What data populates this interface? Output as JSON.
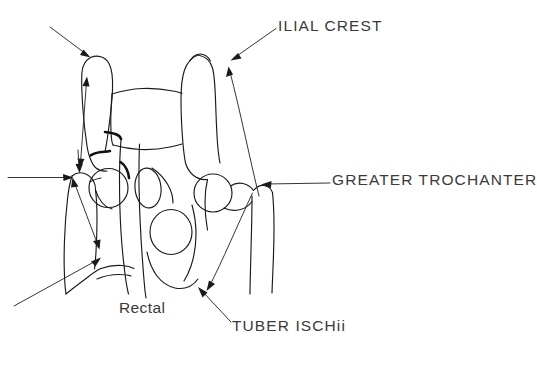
{
  "figure": {
    "kind": "hand-drawn anatomical line drawing",
    "background_color": "#ffffff",
    "ink_color": "#1a1a1a",
    "text_color": "#3a3a3a",
    "width": 514,
    "height": 370
  },
  "labels": {
    "ilial_crest": "ILIAL CREST",
    "greater_trochanter": "GREATER TROCHANTER",
    "tuber_ischii": "TUBER ISCHii",
    "rectal": "Rectal"
  },
  "annotations": [
    {
      "id": "ilial-crest-right",
      "label": "ILIAL CREST",
      "leader_from": [
        272,
        28
      ],
      "points_to": [
        232,
        58
      ],
      "description": "leader from ILIAL CREST text to right ilium crest apex"
    },
    {
      "id": "ilial-crest-left-unlabeled",
      "label": "",
      "leader_from": [
        50,
        26
      ],
      "points_to": [
        90,
        56
      ],
      "description": "unlabeled arrow pointing at left ilium crest apex"
    },
    {
      "id": "greater-trochanter-right",
      "label": "GREATER TROCHANTER",
      "leader_from": [
        328,
        182
      ],
      "points_to": [
        258,
        185
      ],
      "description": "horizontal leader from GREATER TROCHANTER text to right greater trochanter"
    },
    {
      "id": "greater-trochanter-left-unlabeled",
      "label": "",
      "leader_from": [
        8,
        178
      ],
      "points_to": [
        70,
        178
      ],
      "description": "horizontal unlabeled arrow pointing at left greater trochanter"
    },
    {
      "id": "tuber-ischii-left",
      "label": "TUBER ISCHii",
      "leader_from": [
        230,
        325
      ],
      "points_to": [
        198,
        288
      ],
      "description": "leader from TUBER ISCHii text to left tuber ischii"
    },
    {
      "id": "ilium-length-measure",
      "label": "",
      "leader_from": [
        79,
        168
      ],
      "points_to": [
        86,
        78
      ],
      "description": "double-headed vertical measurement arrow along left ilium"
    },
    {
      "id": "femoral-neck-measure",
      "label": "",
      "leader_from": [
        75,
        180
      ],
      "points_to": [
        100,
        250
      ],
      "description": "double-headed oblique measurement arrow across left femoral neck"
    },
    {
      "id": "lower-left-unlabeled",
      "label": "",
      "leader_from": [
        15,
        305
      ],
      "points_to": [
        100,
        258
      ],
      "description": "unlabeled oblique arrow from lower left to left femur"
    },
    {
      "id": "right-ilium-to-trochanter",
      "label": "",
      "leader_from": [
        258,
        192
      ],
      "points_to": [
        228,
        68
      ],
      "description": "long arrow from right greater trochanter region up to right ilial crest"
    },
    {
      "id": "right-trochanter-to-ischium",
      "label": "",
      "leader_from": [
        252,
        190
      ],
      "points_to": [
        206,
        290
      ],
      "description": "long arrow from right greater trochanter down to ischium"
    }
  ],
  "structures": [
    {
      "name": "left-ilium",
      "side": "left"
    },
    {
      "name": "right-ilium",
      "side": "right"
    },
    {
      "name": "sacrum",
      "side": "midline"
    },
    {
      "name": "left-femoral-head",
      "side": "left"
    },
    {
      "name": "right-femoral-head",
      "side": "right"
    },
    {
      "name": "left-greater-trochanter",
      "side": "left"
    },
    {
      "name": "right-greater-trochanter",
      "side": "right"
    },
    {
      "name": "left-femur-shaft",
      "side": "left"
    },
    {
      "name": "right-femur-shaft",
      "side": "right"
    },
    {
      "name": "obturator-foramen",
      "side": "midline"
    },
    {
      "name": "rectal-gas-shadow",
      "side": "midline"
    },
    {
      "name": "tuber-ischii",
      "side": "both"
    }
  ]
}
